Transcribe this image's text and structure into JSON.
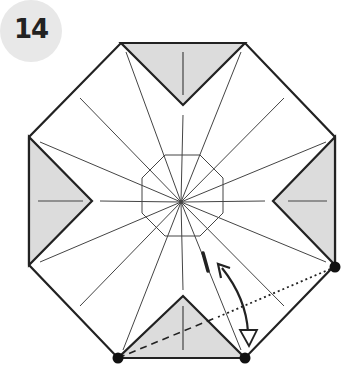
{
  "step": {
    "number": "14"
  },
  "diagram": {
    "shape": "octagon",
    "colors": {
      "paper": "#ffffff",
      "flap": "#dcdcdc",
      "outline": "#222222",
      "crease": "#444444",
      "badge": "#e8e8e8"
    },
    "annotations": [
      "valley-fold-line",
      "mountain-fold-line",
      "fold-arrow",
      "reference-dots"
    ]
  }
}
